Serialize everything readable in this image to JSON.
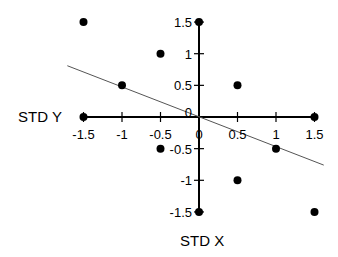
{
  "chart_data": {
    "type": "scatter",
    "title": "",
    "xlabel": "STD X",
    "ylabel": "STD Y",
    "xlim": [
      -1.5,
      1.5
    ],
    "ylim": [
      -1.5,
      1.5
    ],
    "x_ticks": [
      -1.5,
      -1,
      -0.5,
      0,
      0.5,
      1,
      1.5
    ],
    "y_ticks": [
      1.5,
      1,
      0.5,
      0,
      -0.5,
      -1,
      -1.5
    ],
    "x_tick_labels": [
      "-1.5",
      "-1",
      "-0.5",
      "0",
      "0.5",
      "1",
      "1.5"
    ],
    "y_tick_labels": [
      "1.5",
      "1",
      "0.5",
      "0",
      "-0.5",
      "-1",
      "-1.5"
    ],
    "grid": false,
    "legend": null,
    "series": [
      {
        "name": "points",
        "x": [
          -1.5,
          -0.5,
          -1,
          0,
          0.5,
          -1.5,
          1.5,
          -0.5,
          1,
          0.5,
          0,
          1.5
        ],
        "y": [
          1.5,
          1,
          0.5,
          1.5,
          0.5,
          0,
          0,
          -0.5,
          -0.5,
          -1,
          -1.5,
          -1.5
        ]
      }
    ],
    "regression_line": {
      "x": [
        -1.71,
        1.62
      ],
      "y": [
        0.81,
        -0.76
      ],
      "slope": -0.47
    }
  },
  "labels": {
    "x_axis_title": "STD X",
    "y_axis_title": "STD Y"
  },
  "colors": {
    "axis": "#000000",
    "points": "#000000",
    "line": "#555555"
  }
}
